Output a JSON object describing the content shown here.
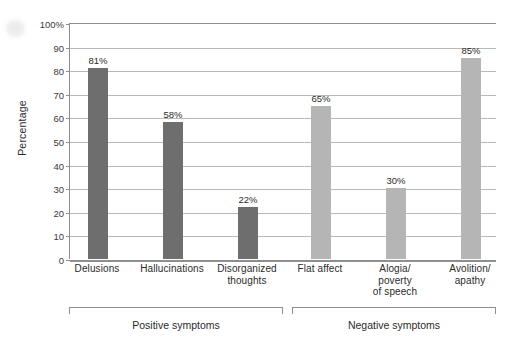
{
  "chart_data": {
    "type": "bar",
    "title": "",
    "xlabel": "",
    "ylabel": "Percentage",
    "ylim": [
      0,
      100
    ],
    "ytick_labels": [
      "0",
      "10",
      "20",
      "30",
      "40",
      "50",
      "60",
      "70",
      "80",
      "90",
      "100%"
    ],
    "ytick_values": [
      0,
      10,
      20,
      30,
      40,
      50,
      60,
      70,
      80,
      90,
      100
    ],
    "grid": true,
    "legend": "none",
    "categories": [
      "Delusions",
      "Hallucinations",
      "Disorganized thoughts",
      "Flat affect",
      "Alogia/ poverty of speech",
      "Avolition/ apathy"
    ],
    "values": [
      81,
      58,
      22,
      65,
      30,
      85
    ],
    "value_labels": [
      "81%",
      "58%",
      "22%",
      "65%",
      "30%",
      "85%"
    ],
    "groups": [
      {
        "label": "Positive symptoms",
        "categories": [
          "Delusions",
          "Hallucinations",
          "Disorganized thoughts"
        ],
        "color": "#6e6e6e"
      },
      {
        "label": "Negative symptoms",
        "categories": [
          "Flat affect",
          "Alogia/ poverty of speech",
          "Avolition/ apathy"
        ],
        "color": "#b5b5b5"
      }
    ]
  },
  "axis": {
    "y_title": "Percentage",
    "ticks": [
      {
        "label": "100%",
        "value": 100
      },
      {
        "label": "90",
        "value": 90
      },
      {
        "label": "80",
        "value": 80
      },
      {
        "label": "70",
        "value": 70
      },
      {
        "label": "60",
        "value": 60
      },
      {
        "label": "50",
        "value": 50
      },
      {
        "label": "40",
        "value": 40
      },
      {
        "label": "30",
        "value": 30
      },
      {
        "label": "20",
        "value": 20
      },
      {
        "label": "10",
        "value": 10
      },
      {
        "label": "0",
        "value": 0
      }
    ]
  },
  "bars": [
    {
      "name": "delusions",
      "label": "Delusions",
      "label_lines": [
        "Delusions"
      ],
      "value": 81,
      "value_label": "81%",
      "color": "#6e6e6e",
      "center": 97,
      "width": 20
    },
    {
      "name": "hallucinations",
      "label": "Hallucinations",
      "label_lines": [
        "Hallucinations"
      ],
      "value": 58,
      "value_label": "58%",
      "color": "#6e6e6e",
      "center": 172,
      "width": 20
    },
    {
      "name": "disorganized-thoughts",
      "label": "Disorganized thoughts",
      "label_lines": [
        "Disorganized",
        "thoughts"
      ],
      "value": 22,
      "value_label": "22%",
      "color": "#6e6e6e",
      "center": 247,
      "width": 20
    },
    {
      "name": "flat-affect",
      "label": "Flat affect",
      "label_lines": [
        "Flat affect"
      ],
      "value": 65,
      "value_label": "65%",
      "color": "#b5b5b5",
      "center": 320,
      "width": 20
    },
    {
      "name": "alogia-poverty-of-speech",
      "label": "Alogia/ poverty of speech",
      "label_lines": [
        "Alogia/",
        "poverty",
        "of speech"
      ],
      "value": 30,
      "value_label": "30%",
      "color": "#b5b5b5",
      "center": 395,
      "width": 20
    },
    {
      "name": "avolition-apathy",
      "label": "Avolition/ apathy",
      "label_lines": [
        "Avolition/",
        "apathy"
      ],
      "value": 85,
      "value_label": "85%",
      "color": "#b5b5b5",
      "center": 470,
      "width": 20
    }
  ],
  "groups": [
    {
      "name": "positive-symptoms",
      "label": "Positive symptoms",
      "left": 69,
      "right": 283
    },
    {
      "name": "negative-symptoms",
      "label": "Negative symptoms",
      "left": 292,
      "right": 496
    }
  ],
  "colors": {
    "positive_bar": "#6e6e6e",
    "negative_bar": "#b5b5b5",
    "gridline": "#b9b9b9",
    "axis": "#8e8e8e",
    "text": "#2b2b2b",
    "background": "#ffffff"
  }
}
